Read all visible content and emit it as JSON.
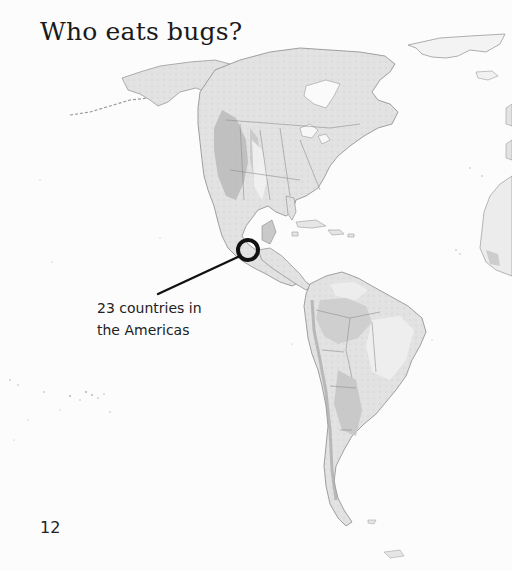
{
  "page": {
    "title": "Who eats bugs?",
    "page_number": "12"
  },
  "callout": {
    "line1": "23 countries in",
    "line2": "the Americas",
    "marker_location": "Mexico / Central America",
    "marker_color": "#111111"
  },
  "map": {
    "region": "The Americas",
    "style": "grayscale shaded relief",
    "colors": {
      "ocean": "#fcfcfc",
      "land_light": "#e6e6e6",
      "land_mid": "#cfcfcf",
      "land_dark": "#a9a9a9",
      "border": "#8a8a8a"
    }
  }
}
